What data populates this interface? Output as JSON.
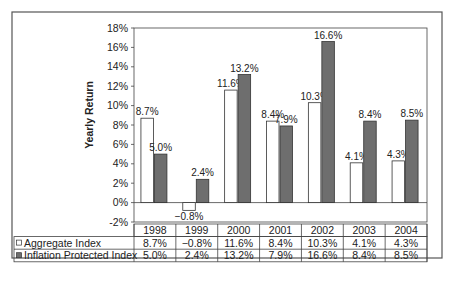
{
  "chart_data": {
    "type": "bar",
    "title": "",
    "xlabel": "",
    "ylabel": "Yearly Return",
    "ylim": [
      -2,
      18
    ],
    "yticks": [
      "18%",
      "16%",
      "14%",
      "12%",
      "10%",
      "8%",
      "6%",
      "4%",
      "2%",
      "0%",
      "-2%"
    ],
    "categories": [
      "1998",
      "1999",
      "2000",
      "2001",
      "2002",
      "2003",
      "2004"
    ],
    "series": [
      {
        "name": "Aggregate Index",
        "fill": "#ffffff",
        "values": [
          8.7,
          -0.8,
          11.6,
          8.4,
          10.3,
          4.1,
          4.3
        ],
        "labels": [
          "8.7%",
          "−0.8%",
          "11.6%",
          "8.4%",
          "10.3%",
          "4.1%",
          "4.3%"
        ]
      },
      {
        "name": "Inflation Protected Index",
        "fill": "#6e6e6e",
        "values": [
          5.0,
          2.4,
          13.2,
          7.9,
          16.6,
          8.4,
          8.5
        ],
        "labels": [
          "5.0%",
          "2.4%",
          "13.2%",
          "7.9%",
          "16.6%",
          "8.4%",
          "8.5%"
        ]
      }
    ],
    "grid": false,
    "legend_position": "data-table-left",
    "data_table": true
  },
  "colors": {
    "frame": "#555555",
    "axis": "#444444",
    "aggregate_fill": "#ffffff",
    "inflation_fill": "#6e6e6e",
    "text": "#222222"
  }
}
